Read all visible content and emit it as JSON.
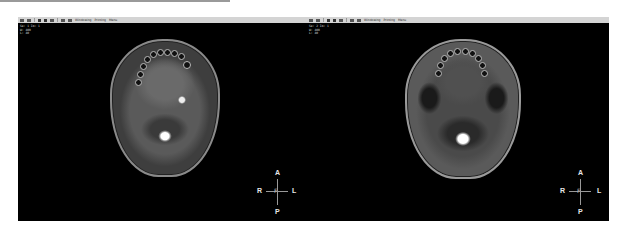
{
  "viewer": {
    "panels": [
      {
        "id": "left",
        "sequence": "T1 post-contrast axial",
        "toolbar": {
          "items": [
            "layout-icon",
            "grid-icon",
            "pan-icon",
            "zoom-icon",
            "contrast-icon",
            "ruler-icon",
            "annotate-icon"
          ],
          "labels": [
            "Windowing",
            "Printing",
            "Menu"
          ]
        },
        "overlay_top_left": [
          "Se: 1  Im: 1",
          "W: 400",
          "L: 40"
        ],
        "overlay_top_right": [
          "",
          ""
        ],
        "orientation": {
          "top": "A",
          "bottom": "P",
          "left": "R",
          "right": "L",
          "center": "F"
        }
      },
      {
        "id": "right",
        "sequence": "T2 axial",
        "toolbar": {
          "items": [
            "layout-icon",
            "grid-icon",
            "pan-icon",
            "zoom-icon",
            "contrast-icon",
            "ruler-icon",
            "annotate-icon"
          ],
          "labels": [
            "Windowing",
            "Printing",
            "Menu"
          ]
        },
        "overlay_top_left": [
          "Se: 2  Im: 1",
          "W: 400",
          "L: 40"
        ],
        "overlay_top_right": [
          "",
          ""
        ],
        "orientation": {
          "top": "A",
          "bottom": "P",
          "left": "R",
          "right": "L",
          "center": "F"
        }
      }
    ]
  }
}
